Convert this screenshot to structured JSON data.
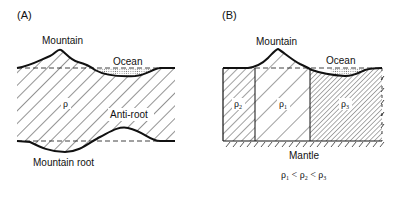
{
  "panel_a": {
    "label": "(A)",
    "mountain": "Mountain",
    "ocean": "Ocean",
    "density": "ρ",
    "anti_root": "Anti-root",
    "mountain_root": "Mountain root"
  },
  "panel_b": {
    "label": "(B)",
    "mountain": "Mountain",
    "ocean": "Ocean",
    "rho": "ρ",
    "col_left_sub": "2",
    "col_mid_sub": "1",
    "col_right_sub": "3",
    "mantle": "Mantle",
    "relation": {
      "r1": "ρ",
      "s1": "1",
      "lt1": " < ",
      "r2": "ρ",
      "s2": "2",
      "lt2": " < ",
      "r3": "ρ",
      "s3": "3"
    }
  },
  "colors": {
    "ink": "#111111",
    "background": "#ffffff"
  }
}
